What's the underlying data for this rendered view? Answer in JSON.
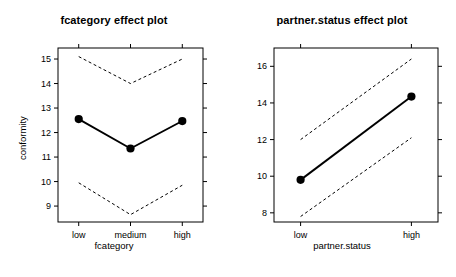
{
  "figure": {
    "background": "#ffffff",
    "foreground": "#000000",
    "panels": 2
  },
  "chart_data": [
    {
      "type": "line",
      "id": "fcategory-effect-plot",
      "title": "fcategory effect plot",
      "xlabel": "fcategory",
      "ylabel": "conformity",
      "categories": [
        "low",
        "medium",
        "high"
      ],
      "x": [
        1,
        2,
        3
      ],
      "xlim": [
        0.6,
        3.4
      ],
      "ylim": [
        8.35,
        15.45
      ],
      "yticks": [
        9,
        10,
        11,
        12,
        13,
        14,
        15
      ],
      "ytick_labels": [
        "9",
        "10",
        "11",
        "12",
        "13",
        "14",
        "15"
      ],
      "grid": false,
      "legend": "none",
      "series": [
        {
          "name": "fit",
          "style": "solid-with-points",
          "values": [
            12.55,
            11.35,
            12.47
          ]
        },
        {
          "name": "upper confidence band",
          "style": "dashed",
          "values": [
            15.1,
            14.0,
            15.0
          ]
        },
        {
          "name": "lower confidence band",
          "style": "dashed",
          "values": [
            9.95,
            8.65,
            9.85
          ]
        }
      ]
    },
    {
      "type": "line",
      "id": "partner-status-effect-plot",
      "title": "partner.status effect plot",
      "xlabel": "partner.status",
      "ylabel": "conformity",
      "categories": [
        "low",
        "high"
      ],
      "x": [
        1,
        2
      ],
      "xlim": [
        0.76,
        2.24
      ],
      "ylim": [
        7.5,
        17.0
      ],
      "yticks": [
        8,
        10,
        12,
        14,
        16
      ],
      "ytick_labels": [
        "8",
        "10",
        "12",
        "14",
        "16"
      ],
      "grid": false,
      "legend": "none",
      "series": [
        {
          "name": "fit",
          "style": "solid-with-points",
          "values": [
            9.8,
            14.35
          ]
        },
        {
          "name": "upper confidence band",
          "style": "dashed",
          "values": [
            12.0,
            16.4
          ]
        },
        {
          "name": "lower confidence band",
          "style": "dashed",
          "values": [
            7.8,
            12.1
          ]
        }
      ]
    }
  ]
}
